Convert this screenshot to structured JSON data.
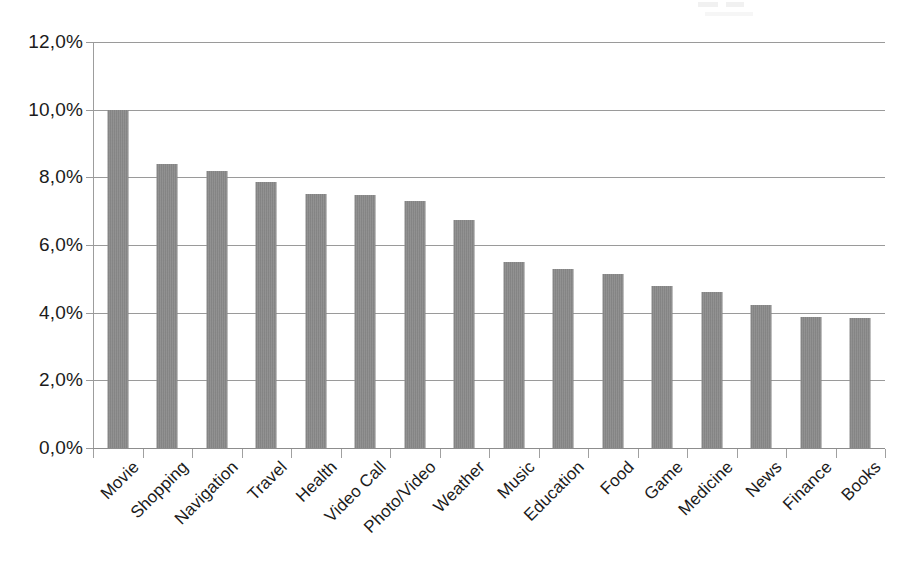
{
  "chart_data": {
    "type": "bar",
    "title": "",
    "subtitle": "",
    "xlabel": "",
    "ylabel": "",
    "categories": [
      "Movie",
      "Shopping",
      "Navigation",
      "Travel",
      "Health",
      "Video Call",
      "Photo/Video",
      "Weather",
      "Music",
      "Education",
      "Food",
      "Game",
      "Medicine",
      "News",
      "Finance",
      "Books"
    ],
    "values": [
      10.0,
      8.38,
      8.18,
      7.85,
      7.5,
      7.48,
      7.3,
      6.75,
      5.5,
      5.3,
      5.15,
      4.8,
      4.6,
      4.23,
      3.87,
      3.85
    ],
    "value_unit": "%",
    "ylim": [
      0.0,
      12.0
    ],
    "ytick_step": 2.0,
    "ytick_labels": [
      "12,0%",
      "10,0%",
      "8,0%",
      "6,0%",
      "4,0%",
      "2,0%",
      "0,0%"
    ],
    "ytick_values": [
      12.0,
      10.0,
      8.0,
      6.0,
      4.0,
      2.0,
      0.0
    ],
    "grid": true,
    "grid_axis": "y",
    "legend": false,
    "legend_position": "none",
    "series": [
      {
        "name": "",
        "values": [
          10.0,
          8.38,
          8.18,
          7.85,
          7.5,
          7.48,
          7.3,
          6.75,
          5.5,
          5.3,
          5.15,
          4.8,
          4.6,
          4.23,
          3.87,
          3.85
        ]
      }
    ],
    "bar_color": "#8b8b8b",
    "grid_color": "#9a9a9a",
    "axis_color": "#8d8d8d",
    "text_color": "#1b1b1b",
    "background_color": "#ffffff",
    "xtick_label_rotation": -45,
    "annotations": []
  }
}
